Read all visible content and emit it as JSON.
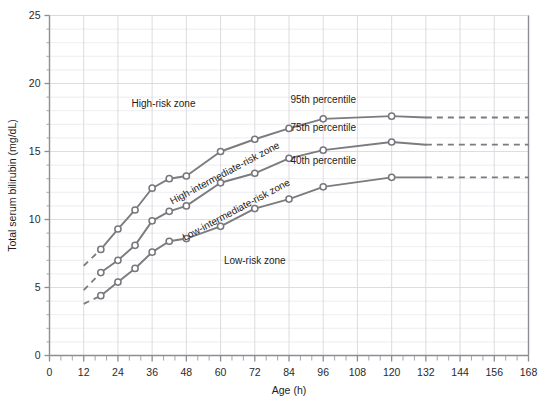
{
  "chart_data": {
    "type": "line",
    "title": "",
    "subtitle": "",
    "xlabel": "Age (h)",
    "ylabel": "Total serum bilirubin (mg/dL)",
    "xlim": [
      0,
      168
    ],
    "ylim": [
      0,
      25
    ],
    "xticks": [
      0,
      12,
      24,
      36,
      48,
      60,
      72,
      84,
      96,
      108,
      120,
      132,
      144,
      156,
      168
    ],
    "xtick_labels": [
      "0",
      "12",
      "24",
      "36",
      "48",
      "60",
      "72",
      "84",
      "96",
      "108",
      "120",
      "132",
      "144",
      "156",
      "168"
    ],
    "xminor_step": 4,
    "yticks": [
      0,
      5,
      10,
      15,
      20,
      25
    ],
    "ytick_labels": [
      "0",
      "5",
      "10",
      "15",
      "20",
      "25"
    ],
    "yminor_step": 1,
    "grid": "both",
    "legend_position": "inline-annotations",
    "line_color": "#7b7b80",
    "marker_style": "open-circle",
    "series": [
      {
        "name": "95th percentile",
        "label": "95th percentile",
        "dashed_lead_in": {
          "x": [
            12,
            18
          ],
          "y": [
            6.6,
            7.8
          ]
        },
        "x": [
          18,
          24,
          30,
          36,
          42,
          48,
          60,
          72,
          84,
          96,
          120
        ],
        "y": [
          7.8,
          9.3,
          10.7,
          12.3,
          13.0,
          13.2,
          15.0,
          15.9,
          16.7,
          17.4,
          17.6
        ],
        "dashed_tail": {
          "x": [
            132,
            168
          ],
          "y": [
            17.5,
            17.5
          ]
        }
      },
      {
        "name": "75th percentile",
        "label": "75th percentile",
        "dashed_lead_in": {
          "x": [
            12,
            18
          ],
          "y": [
            4.8,
            6.1
          ]
        },
        "x": [
          18,
          24,
          30,
          36,
          42,
          48,
          60,
          72,
          84,
          96,
          120
        ],
        "y": [
          6.1,
          7.0,
          8.1,
          9.9,
          10.6,
          11.0,
          12.7,
          13.4,
          14.5,
          15.1,
          15.7
        ],
        "dashed_tail": {
          "x": [
            132,
            168
          ],
          "y": [
            15.5,
            15.5
          ]
        }
      },
      {
        "name": "40th percentile",
        "label": "40th percentile",
        "dashed_lead_in": {
          "x": [
            12,
            18
          ],
          "y": [
            3.8,
            4.4
          ]
        },
        "x": [
          18,
          24,
          30,
          36,
          42,
          48,
          60,
          72,
          84,
          96,
          120
        ],
        "y": [
          4.4,
          5.4,
          6.4,
          7.6,
          8.4,
          8.6,
          9.5,
          10.8,
          11.5,
          12.4,
          13.1
        ],
        "dashed_tail": {
          "x": [
            132,
            168
          ],
          "y": [
            13.1,
            13.1
          ]
        }
      }
    ],
    "annotations": [
      {
        "text": "High-risk zone",
        "x": 40,
        "y": 18.3,
        "rotation": 0
      },
      {
        "text": "High-intermediate-risk zone",
        "x": 62,
        "y": 13.2,
        "rotation": -28
      },
      {
        "text": "Low-intermediate-risk zone",
        "x": 66,
        "y": 10.5,
        "rotation": -28
      },
      {
        "text": "Low-risk zone",
        "x": 72,
        "y": 6.7,
        "rotation": 0
      },
      {
        "text": "95th percentile",
        "x": 96,
        "y": 18.6,
        "rotation": 0
      },
      {
        "text": "75th percentile",
        "x": 96,
        "y": 16.5,
        "rotation": 0
      },
      {
        "text": "40th percentile",
        "x": 96,
        "y": 14.1,
        "rotation": 0
      }
    ]
  }
}
